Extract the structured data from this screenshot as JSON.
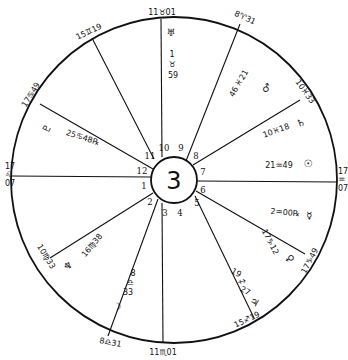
{
  "chart": {
    "center_label": "3",
    "outer_circle": {
      "cx": 174,
      "cy": 180,
      "r": 163
    },
    "inner_circle": {
      "cx": 174,
      "cy": 180,
      "r": 23
    },
    "line_color": "#111111",
    "background": "#ffffff"
  },
  "house_numbers": [
    "1",
    "2",
    "3",
    "4",
    "5",
    "6",
    "7",
    "8",
    "9",
    "10",
    "11",
    "12"
  ],
  "cusps": [
    {
      "house": 10,
      "label": "11♉01"
    },
    {
      "house": 11,
      "label": "15♊19"
    },
    {
      "house": 12,
      "label": "17♋49"
    },
    {
      "house": 1,
      "label_top": "17",
      "label_sign": "♌",
      "label_bottom": "07"
    },
    {
      "house": 2,
      "label": "10♍33"
    },
    {
      "house": 3,
      "label": "8♎31"
    },
    {
      "house": 4,
      "label": "11♏01"
    },
    {
      "house": 5,
      "label": "15♐19"
    },
    {
      "house": 6,
      "label": "17♑49"
    },
    {
      "house": 7,
      "label_top": "17",
      "label_sign": "♒",
      "label_bottom": "07"
    },
    {
      "house": 8,
      "label": "8♈31"
    },
    {
      "house": 9,
      "label": "10♓33"
    }
  ],
  "planets": [
    {
      "name": "Uranus",
      "glyph": "♅",
      "position": "1♉59",
      "deg": "1",
      "sign": "♉",
      "min": "59"
    },
    {
      "name": "Mars",
      "glyph": "♂",
      "position": "21♓46",
      "deg": "21",
      "sign": "♓",
      "min": "46"
    },
    {
      "name": "Saturn",
      "glyph": "♄",
      "position": "10♓18",
      "text": "10♓18"
    },
    {
      "name": "Sun",
      "glyph": "☉",
      "position": "21♒49",
      "text": "21♒49"
    },
    {
      "name": "Mercury",
      "glyph": "☿",
      "position": "2♒00℞",
      "text": "2♒00℞"
    },
    {
      "name": "Venus",
      "glyph": "♀",
      "position": "17♑12",
      "text": "17♑12"
    },
    {
      "name": "Jupiter",
      "glyph": "♃",
      "position": "19♐27",
      "deg": "19",
      "sign": "♐",
      "min": "27"
    },
    {
      "name": "Moon",
      "glyph": "☽",
      "position": "8♎33",
      "deg": "8",
      "sign": "♎",
      "min": "33"
    },
    {
      "name": "Neptune",
      "glyph": "♆",
      "position": "16♍38",
      "text": "16♍38"
    },
    {
      "name": "Pluto",
      "glyph": "♇",
      "position": "25♋48℞",
      "text": "25♋48℞"
    }
  ]
}
